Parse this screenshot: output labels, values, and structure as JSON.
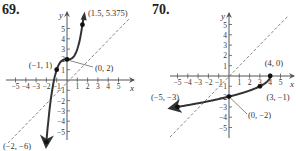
{
  "chart_data": [
    {
      "type": "line",
      "problem_number": "69.",
      "xlabel": "x",
      "ylabel": "y",
      "xlim": [
        -5,
        5
      ],
      "ylim": [
        -5,
        5
      ],
      "x_ticks": [
        "-5",
        "-4",
        "-3",
        "-2",
        "-1",
        "1",
        "2",
        "3",
        "4",
        "5"
      ],
      "y_ticks": [
        "5",
        "4",
        "3",
        "2",
        "1",
        "-1",
        "-2",
        "-3",
        "-4",
        "-5"
      ],
      "reference_line": "y = x (dashed)",
      "curve": "y = x^3 + 2 (cubic, arrows at both ends)",
      "points": [
        {
          "x": -2,
          "y": -6,
          "label": "(−2, −6)"
        },
        {
          "x": -1,
          "y": 1,
          "label": "(−1, 1)"
        },
        {
          "x": 0,
          "y": 2,
          "label": "(0, 2)"
        },
        {
          "x": 1.5,
          "y": 5.375,
          "label": "(1.5, 5.375)"
        }
      ]
    },
    {
      "type": "line",
      "problem_number": "70.",
      "xlabel": "x",
      "ylabel": "y",
      "xlim": [
        -5,
        5
      ],
      "ylim": [
        -5,
        5
      ],
      "x_ticks": [
        "-5",
        "-4",
        "-3",
        "-2",
        "-1",
        "1",
        "2",
        "3",
        "4",
        "5"
      ],
      "y_ticks": [
        "5",
        "4",
        "3",
        "2",
        "1",
        "-1",
        "-2",
        "-3",
        "-4",
        "-5"
      ],
      "reference_line": "y = x (dashed)",
      "curve": "y = -sqrt(4 - x) (endpoint at (4,0), arrow toward left)",
      "points": [
        {
          "x": 4,
          "y": 0,
          "label": "(4, 0)"
        },
        {
          "x": 3,
          "y": -1,
          "label": "(3, −1)"
        },
        {
          "x": 0,
          "y": -2,
          "label": "(0, −2)"
        },
        {
          "x": -5,
          "y": -3,
          "label": "(−5, −3)"
        }
      ]
    }
  ],
  "labels": {
    "p69": "69.",
    "p70": "70."
  }
}
